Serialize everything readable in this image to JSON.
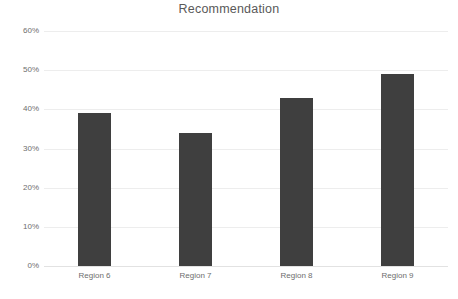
{
  "chart_data": {
    "type": "bar",
    "title": "Recommendation",
    "xlabel": "",
    "ylabel": "",
    "categories": [
      "Region 6",
      "Region 7",
      "Region 8",
      "Region 9"
    ],
    "values": [
      39,
      34,
      43,
      49
    ],
    "value_labels": [
      "39%",
      "34%",
      "43%",
      "49%"
    ],
    "ylim": [
      0,
      60
    ],
    "ytick_values": [
      0,
      10,
      20,
      30,
      40,
      50,
      60
    ],
    "ytick_labels": [
      "0%",
      "10%",
      "20%",
      "30%",
      "40%",
      "50%",
      "60%"
    ],
    "grid": true,
    "legend": false,
    "legend_position": "none",
    "series_color": "#3F3F3F",
    "gridline_color": "#EDEDED",
    "background_color": "#FFFFFF",
    "title_color": "#595959",
    "tick_label_color": "#6E6E6E"
  }
}
